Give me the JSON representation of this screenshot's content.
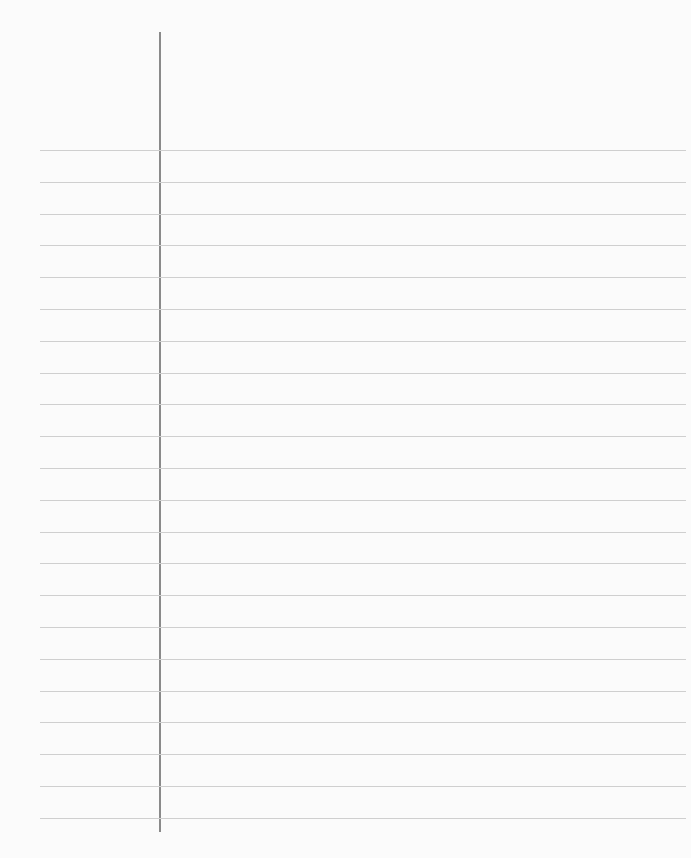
{
  "paper": {
    "type": "lined-paper",
    "line_count": 22,
    "first_line_y": 150,
    "line_spacing": 31.8,
    "line_color": "#cfcfcf",
    "margin_line_color": "#8a8a8a",
    "background": "#fbfbfb"
  }
}
